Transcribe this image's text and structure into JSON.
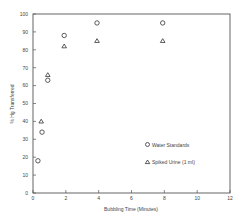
{
  "chart_data": {
    "type": "scatter",
    "title": "",
    "xlabel": "Bubbling Time (Minutes)",
    "ylabel": "% Hg Transferred",
    "xlim": [
      0,
      12
    ],
    "ylim": [
      0,
      100
    ],
    "x_ticks": [
      0,
      2,
      4,
      6,
      8,
      10,
      12
    ],
    "y_ticks": [
      0,
      10,
      20,
      30,
      40,
      50,
      60,
      70,
      80,
      90,
      100
    ],
    "grid": false,
    "legend_position": "lower right inside",
    "series": [
      {
        "name": "Water Standards",
        "marker": "circle",
        "points": [
          [
            0.3,
            18
          ],
          [
            0.55,
            34
          ],
          [
            0.9,
            63
          ],
          [
            1.9,
            88
          ],
          [
            3.9,
            95
          ],
          [
            7.9,
            95
          ]
        ]
      },
      {
        "name": "Spiked Urine (1 ml)",
        "marker": "triangle",
        "points": [
          [
            0.5,
            40
          ],
          [
            0.9,
            66
          ],
          [
            1.9,
            82
          ],
          [
            3.9,
            85
          ],
          [
            7.9,
            85
          ]
        ]
      }
    ]
  }
}
